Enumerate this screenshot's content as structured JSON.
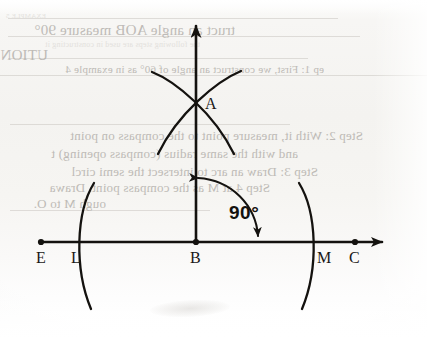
{
  "document": {
    "kind": "scanned-textbook-page",
    "figure_title": "Construction of a 90 degree angle at point B on line EC"
  },
  "bleed_through_text": {
    "note": "Faint mirrored show-through text from the reverse side of the page",
    "lines": [
      {
        "text": "EXAMPLE 5",
        "x": 14,
        "y": 12,
        "size": 7,
        "style": "faint"
      },
      {
        "text": "truct an angle AOB measure 90°",
        "x": 10,
        "y": 22,
        "size": 15,
        "style": "dark"
      },
      {
        "text": "the following steps are used in constructing it",
        "x": 12,
        "y": 40,
        "size": 8,
        "style": "faint"
      },
      {
        "text": "UTION",
        "x": 10,
        "y": 47,
        "size": 15,
        "style": "dark"
      },
      {
        "text": "ep 1: First, we construct an angle of 60° as in example 4",
        "x": 10,
        "y": 63,
        "size": 11,
        "style": "dark"
      },
      {
        "text": "Step 2: With it, measure point to the compass on point",
        "x": 12,
        "y": 128,
        "size": 13,
        "style": "dark"
      },
      {
        "text": "and with the same radius (compass opening) t",
        "x": 12,
        "y": 146,
        "size": 13,
        "style": "dark"
      },
      {
        "text": "Step 3: Draw an arc to intersect the semi circl",
        "x": 12,
        "y": 164,
        "size": 13,
        "style": "dark"
      },
      {
        "text": "Step 4 at M as the compass point. Drawa",
        "x": 16,
        "y": 180,
        "size": 13,
        "style": "dark"
      },
      {
        "text": "ough M to O.",
        "x": 28,
        "y": 196,
        "size": 13,
        "style": "dark"
      }
    ],
    "rules": [
      {
        "x": 8,
        "y": 18,
        "width": 330
      },
      {
        "x": 8,
        "y": 36,
        "width": 352
      },
      {
        "x": 8,
        "y": 58,
        "width": 300
      },
      {
        "x": 0,
        "y": 75,
        "width": 427
      },
      {
        "x": 10,
        "y": 124,
        "width": 280
      },
      {
        "x": 10,
        "y": 210,
        "width": 200
      }
    ]
  },
  "figure": {
    "type": "geometric-construction",
    "baseline": {
      "name": "line-EC",
      "y": 242,
      "x_start": 41,
      "x_end": 393,
      "has_arrow_right": true,
      "has_endpoint_dot_left": true
    },
    "vertical_ray": {
      "name": "ray-BA",
      "x": 196,
      "y_top": 13,
      "y_bottom": 242,
      "has_arrow_top": true
    },
    "points": [
      {
        "label": "E",
        "x": 41,
        "y": 242,
        "label_x": 36,
        "label_y": 250,
        "dot": true
      },
      {
        "label": "L",
        "x": 77,
        "y": 242,
        "label_x": 71,
        "label_y": 250,
        "dot": false
      },
      {
        "label": "B",
        "x": 196,
        "y": 242,
        "label_x": 190,
        "label_y": 250,
        "dot": true
      },
      {
        "label": "M",
        "x": 315,
        "y": 242,
        "label_x": 317,
        "label_y": 250,
        "dot": false
      },
      {
        "label": "C",
        "x": 355,
        "y": 242,
        "label_x": 349,
        "label_y": 250,
        "dot": true
      },
      {
        "label": "A",
        "x": 196,
        "y": 98,
        "label_x": 205,
        "label_y": 96,
        "dot": false
      }
    ],
    "arcs": [
      {
        "name": "arc-left-through-L",
        "d": "M 94,183 C 76,212 74,268 91,309"
      },
      {
        "name": "arc-right-through-M",
        "d": "M 299,183 C 317,212 319,268 302,309"
      },
      {
        "name": "arc-upper-left-to-lower-right",
        "d": "M 152,72 C 175,81 214,113 234,154"
      },
      {
        "name": "arc-lower-left-to-upper-right",
        "d": "M 158,154 C 178,113 217,81 241,71"
      }
    ],
    "angle_annotation": {
      "label": "90°",
      "label_x": 229,
      "label_y": 203,
      "arc_path": "M 198,178 C 232,180 256,206 258,236",
      "has_arrow_start": true,
      "has_arrow_end": true
    }
  },
  "colors": {
    "ink": "#14120f",
    "paper": "#f6f5f2",
    "bleed_text": "#b9b6b1"
  }
}
